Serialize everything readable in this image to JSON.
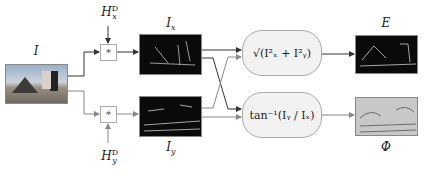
{
  "input": {
    "label": "I"
  },
  "kernels": {
    "x": {
      "label": "H",
      "sup": "D",
      "sub": "x"
    },
    "y": {
      "label": "H",
      "sup": "D",
      "sub": "y"
    }
  },
  "conv_symbol": "*",
  "gradients": {
    "x": {
      "label": "I",
      "sub": "x"
    },
    "y": {
      "label": "I",
      "sub": "y"
    }
  },
  "operations": {
    "magnitude": {
      "formula": "√(I²ₓ + I²ᵧ)"
    },
    "orientation": {
      "formula": "tan⁻¹(Iᵧ / Iₓ)"
    }
  },
  "outputs": {
    "magnitude": {
      "label": "E"
    },
    "orientation": {
      "label": "Φ"
    }
  },
  "colors": {
    "wire_dark": "#333333",
    "wire_light": "#888888",
    "op_fill": "#f2f2f2"
  }
}
